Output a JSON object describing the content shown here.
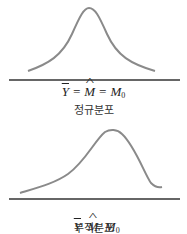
{
  "diagrams": [
    {
      "name": "normal-distribution",
      "caption": "정규분포",
      "equation": {
        "mean": "Y",
        "median": "M",
        "mode": "M",
        "mode_sub": "0",
        "sep": " = "
      }
    },
    {
      "name": "skewed-distribution",
      "caption": "부적분포",
      "equation": {
        "mean": "Y",
        "median": "M",
        "mode": "M",
        "mode_sub": "0",
        "sep": "  "
      }
    }
  ],
  "colors": {
    "curve": "#8a8a8a",
    "baseline": "#333333",
    "text": "#222222"
  }
}
